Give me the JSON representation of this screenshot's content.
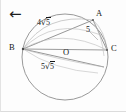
{
  "canvas": {
    "width": 126,
    "height": 112,
    "background": "#fdfdfd"
  },
  "nav": {
    "back_icon": "left-arrow-icon",
    "back_glyph": "←"
  },
  "figure": {
    "type": "circle-geometry-diagram",
    "stroke_color": "#8a8a8a",
    "chord_color": "#8f8f8f",
    "label_color": "#171717",
    "circle": {
      "cx": 64,
      "cy": 57,
      "r": 43
    },
    "points": [
      {
        "name": "A",
        "label": "A",
        "x": 92,
        "y": 20,
        "label_x": 95,
        "label_y": 10
      },
      {
        "name": "B",
        "label": "B",
        "x": 22,
        "y": 49,
        "label_x": 9,
        "label_y": 43
      },
      {
        "name": "C",
        "label": "C",
        "x": 106,
        "y": 50,
        "label_x": 109,
        "label_y": 44
      },
      {
        "name": "O",
        "label": "O",
        "x": 64,
        "y": 57,
        "label_x": 63,
        "label_y": 49
      },
      {
        "name": "D",
        "label": "",
        "x": 103,
        "y": 67,
        "label_x": 0,
        "label_y": 0
      }
    ],
    "segments": [
      {
        "name": "segment-BA",
        "from": "B",
        "to": "A"
      },
      {
        "name": "segment-AC",
        "from": "A",
        "to": "C"
      },
      {
        "name": "segment-BC-diameter",
        "from": "B",
        "to": "C"
      },
      {
        "name": "segment-BD",
        "from": "B",
        "to": "D"
      }
    ],
    "measure_labels": [
      {
        "name": "length-label-BA",
        "coef": "4",
        "radicand": "5",
        "text": "4√5",
        "x": 36,
        "y": 22
      },
      {
        "name": "length-label-AC",
        "coef": "5",
        "radicand": "",
        "text": "5",
        "x": 85,
        "y": 29
      },
      {
        "name": "length-label-BD",
        "coef": "5",
        "radicand": "5",
        "text": "5√5",
        "x": 40,
        "y": 66
      }
    ]
  }
}
